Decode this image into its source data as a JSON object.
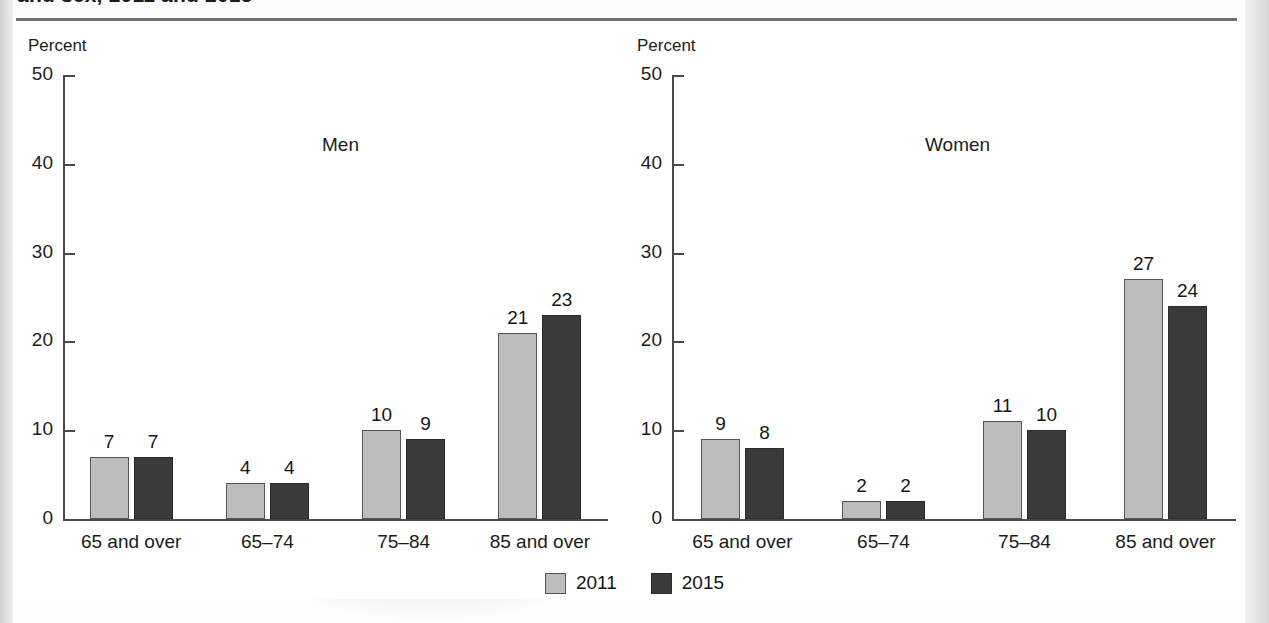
{
  "figure": {
    "title_clipped": "and sex, 2011 and 2015"
  },
  "legend": {
    "items": [
      {
        "label": "2011",
        "color": "#bdbdbd",
        "key": "s2011"
      },
      {
        "label": "2015",
        "color": "#3a3a3a",
        "key": "s2015"
      }
    ]
  },
  "panels": [
    {
      "name": "Men",
      "unit_label": "Percent",
      "y_ticks": [
        "0",
        "10",
        "20",
        "30",
        "40",
        "50"
      ],
      "categories": [
        "65 and over",
        "65–74",
        "75–84",
        "85 and over"
      ],
      "values_2011": [
        "7",
        "4",
        "10",
        "21"
      ],
      "values_2015": [
        "7",
        "4",
        "9",
        "23"
      ]
    },
    {
      "name": "Women",
      "unit_label": "Percent",
      "y_ticks": [
        "0",
        "10",
        "20",
        "30",
        "40",
        "50"
      ],
      "categories": [
        "65 and over",
        "65–74",
        "75–84",
        "85 and over"
      ],
      "values_2011": [
        "9",
        "2",
        "11",
        "27"
      ],
      "values_2015": [
        "8",
        "2",
        "10",
        "24"
      ]
    }
  ],
  "chart_data": {
    "type": "bar",
    "title": "and sex, 2011 and 2015",
    "xlabel": "",
    "ylabel": "Percent",
    "ylim": [
      0,
      50
    ],
    "yticks": [
      0,
      10,
      20,
      30,
      40,
      50
    ],
    "grid": false,
    "legend_position": "bottom-center",
    "panels": [
      {
        "panel": "Men",
        "categories": [
          "65 and over",
          "65–74",
          "75–84",
          "85 and over"
        ],
        "series": [
          {
            "name": "2011",
            "values": [
              7,
              4,
              10,
              21
            ],
            "color": "#bdbdbd"
          },
          {
            "name": "2015",
            "values": [
              7,
              4,
              9,
              23
            ],
            "color": "#3a3a3a"
          }
        ]
      },
      {
        "panel": "Women",
        "categories": [
          "65 and over",
          "65–74",
          "75–84",
          "85 and over"
        ],
        "series": [
          {
            "name": "2011",
            "values": [
              9,
              2,
              11,
              27
            ],
            "color": "#bdbdbd"
          },
          {
            "name": "2015",
            "values": [
              8,
              2,
              10,
              24
            ],
            "color": "#3a3a3a"
          }
        ]
      }
    ]
  }
}
